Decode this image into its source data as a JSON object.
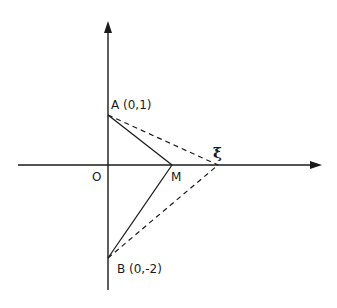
{
  "diagram": {
    "labels": {
      "A": "A (0,1)",
      "B": "B (0,-2)",
      "O": "O",
      "M": "M",
      "xi": "ξ"
    },
    "points": {
      "A": {
        "x": 0,
        "y": 1
      },
      "B": {
        "x": 0,
        "y": -2
      },
      "O": {
        "x": 0,
        "y": 0
      }
    },
    "segments": {
      "solid": [
        "A-M",
        "B-M"
      ],
      "dashed": [
        "A-ξ",
        "B-ξ"
      ]
    },
    "colors": {
      "stroke": "#1a1a1a",
      "background": "#ffffff"
    }
  }
}
